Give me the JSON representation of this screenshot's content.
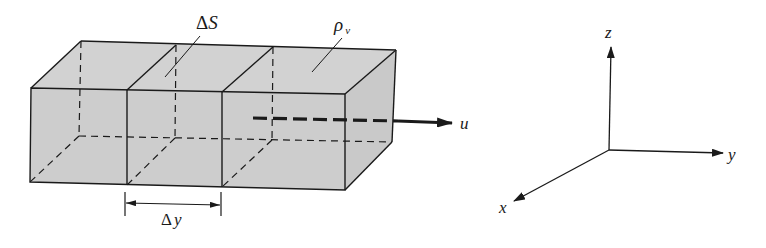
{
  "figure": {
    "labels": {
      "surface_area": "ΔS",
      "surface_area_delta": "Δ",
      "surface_area_var": "S",
      "charge_density": "ρ",
      "charge_density_sub": "v",
      "velocity": "u",
      "slice_thickness_delta": "Δ",
      "slice_thickness_var": "y"
    },
    "axes": {
      "x": "x",
      "y": "y",
      "z": "z"
    },
    "colors": {
      "fill": "#cfcfcf",
      "fill_side": "#c8c8c8",
      "fill_top": "#d4d4d4",
      "line": "#1a1a1a",
      "background": "#ffffff"
    },
    "slices": 3
  }
}
